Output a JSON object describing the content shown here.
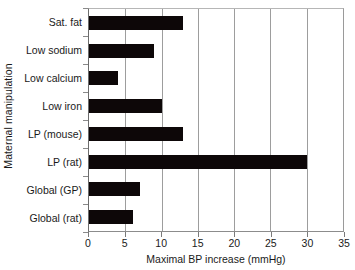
{
  "chart_data": {
    "type": "bar",
    "orientation": "horizontal",
    "title": "",
    "xlabel": "Maximal BP increase (mmHg)",
    "ylabel": "Maternal manipulation",
    "categories": [
      "Sat. fat",
      "Low sodium",
      "Low calcium",
      "Low iron",
      "LP (mouse)",
      "LP (rat)",
      "Global (GP)",
      "Global (rat)"
    ],
    "values": [
      13,
      9,
      4,
      10,
      13,
      30,
      7,
      6
    ],
    "xlim": [
      0,
      35
    ],
    "xticks": [
      0,
      5,
      10,
      15,
      20,
      25,
      30,
      35
    ],
    "xtick_labels": [
      "0",
      "5",
      "10",
      "15",
      "20",
      "25",
      "30",
      "35"
    ],
    "grid": "vertical",
    "legend": "none",
    "bar_color": "#0d0708",
    "gridline_color": "#9d9d9d",
    "frame_color": "#8a8a8a",
    "background_color": "#ffffff"
  }
}
